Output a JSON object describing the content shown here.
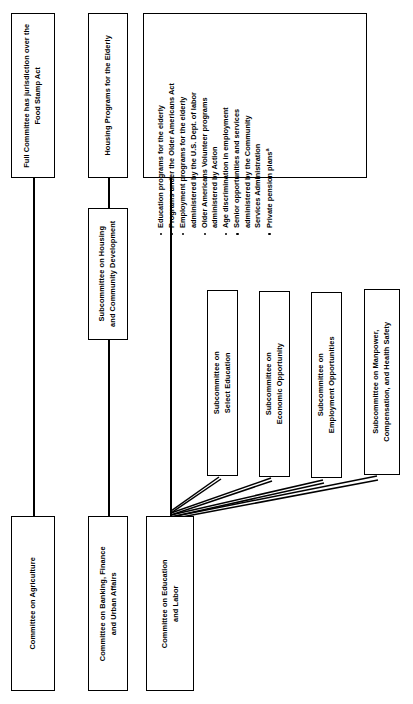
{
  "diagram": {
    "orientation": "rotated-90-ccw",
    "line_color": "#000000",
    "box_fill": "#ffffff"
  },
  "top_notes": {
    "agriculture_note": "Full Committee has jurisdiction over the\nFood Stamp Act",
    "banking_note": "Housing Programs for the Elderly"
  },
  "education_panel": {
    "bullets": [
      "Education programs for the elderly",
      "Programs under the Older Americans Act",
      "Employment programs for the elderly\nadministered by the U.S. Dept. of labor",
      "Older Americans Volunteer programs\nadministered by Action",
      "Age discrimination in employment",
      "Senior opportunities and services\nadministered by the Community\nServices Administration",
      "Private pension plans"
    ],
    "last_bullet_superscript": "a"
  },
  "committees": [
    {
      "id": "agriculture",
      "label": "Committee on Agriculture"
    },
    {
      "id": "banking",
      "label": "Committee on Banking, Finance\nand Urban Affairs"
    },
    {
      "id": "education",
      "label": "Committee on Education\nand Labor"
    }
  ],
  "subcommittees": [
    {
      "id": "housing-community-development",
      "label": "Subcommittee on Housing\nand Community Development",
      "parent": "banking"
    },
    {
      "id": "select-education",
      "label": "Subcommittee on\nSelect Education",
      "parent": "education"
    },
    {
      "id": "economic-opportunity",
      "label": "Subcommittee on\nEconomic Opportunity",
      "parent": "education"
    },
    {
      "id": "employment-opportunities",
      "label": "Subcommittee on\nEmployment Opportunities",
      "parent": "education"
    },
    {
      "id": "manpower-compensation-health-safety",
      "label": "Subcommittee on Manpower,\nCompensation, and Health Safety",
      "parent": "education"
    }
  ]
}
